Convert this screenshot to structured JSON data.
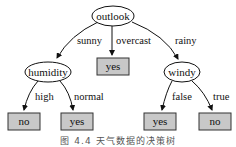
{
  "diagram": {
    "type": "decision-tree",
    "root": {
      "label": "outlook",
      "shape": "ellipse"
    },
    "branches": {
      "sunny": "sunny",
      "overcast": "overcast",
      "rainy": "rainy",
      "high": "high",
      "normal": "normal",
      "false": "false",
      "true": "true"
    },
    "nodes": {
      "humidity": "humidity",
      "windy": "windy",
      "overcast_leaf": "yes",
      "humidity_high_leaf": "no",
      "humidity_normal_leaf": "yes",
      "windy_false_leaf": "yes",
      "windy_true_leaf": "no"
    },
    "leaf_fill": "#c8c8c8",
    "caption": "图 4.4 天气数据的决策树"
  }
}
